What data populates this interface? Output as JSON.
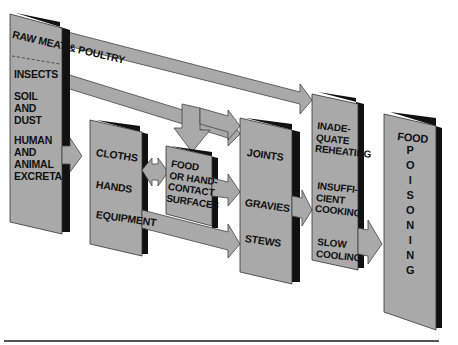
{
  "diagram": {
    "title_cut_off": "",
    "colors": {
      "box_fill": "#a9a9a9",
      "box_shadow": "#111111",
      "arrow_fill": "#a9a9a9",
      "arrow_stroke": "#444444",
      "rule": "#555555"
    },
    "sources_box": {
      "top_label": "RAW MEAT & POULTRY",
      "items": [
        "INSECTS",
        "SOIL\nAND\nDUST",
        "HUMAN\nAND\nANIMAL\nEXCRETA"
      ]
    },
    "vectors_box": {
      "items": [
        "CLOTHS",
        "HANDS",
        "EQUIPMENT"
      ]
    },
    "surfaces_box": {
      "label": "FOOD\nOR HAND-\nCONTACT\nSURFACES"
    },
    "foods_box": {
      "items": [
        "JOINTS",
        "GRAVIES",
        "STEWS"
      ]
    },
    "errors_box": {
      "items": [
        "INADE-\nQUATE\nREHEATING",
        "INSUFFI-\nCIENT\nCOOKING",
        "SLOW\nCOOLING"
      ]
    },
    "outcome_box": {
      "label_top": "FOOD",
      "label_vertical": "P\nO\nI\nS\nO\nN\nI\nN\nG"
    },
    "flows": [
      {
        "from": "RAW MEAT & POULTRY",
        "to": "errors_box"
      },
      {
        "from": "INSECTS",
        "to": "foods_box"
      },
      {
        "from": "INSECTS",
        "to": "surfaces_box"
      },
      {
        "from": "sources_box",
        "to": "vectors_box"
      },
      {
        "from": "vectors_box",
        "to": "surfaces_box",
        "bidirectional": true
      },
      {
        "from": "surfaces_box",
        "to": "foods_box"
      },
      {
        "from": "EQUIPMENT",
        "to": "foods_box"
      },
      {
        "from": "foods_box",
        "to": "errors_box"
      },
      {
        "from": "errors_box",
        "to": "outcome_box"
      }
    ]
  }
}
